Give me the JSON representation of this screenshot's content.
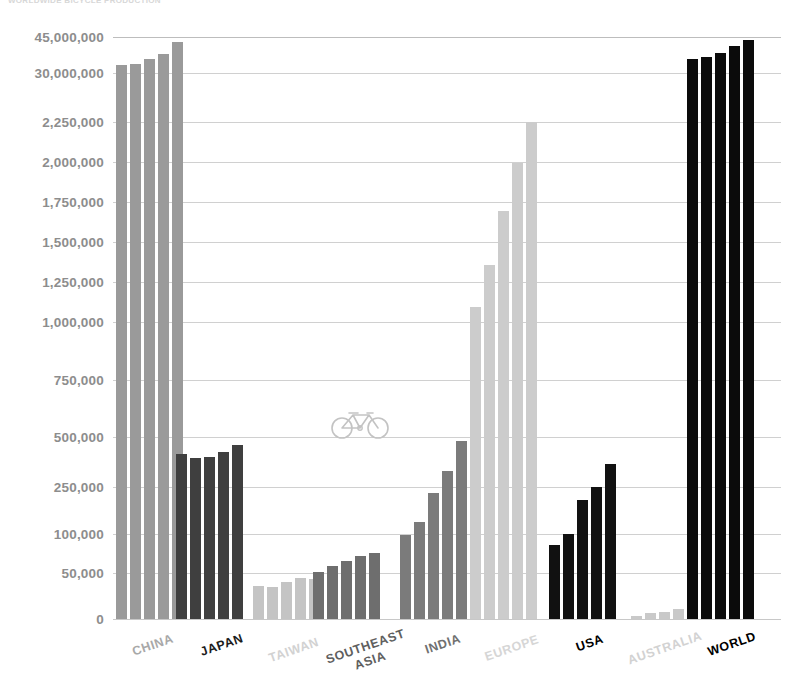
{
  "header": {
    "cropped_text": "WORLDWIDE BICYCLE PRODUCTION"
  },
  "chart_data": {
    "type": "bar",
    "title": "",
    "xlabel": "",
    "ylabel": "",
    "grid": true,
    "legend": false,
    "axis_note": "broken / non-linear y-axis: compressed above 2,250,000",
    "ytick_labels": [
      "45,000,000",
      "30,000,000",
      "2,250,000",
      "2,000,000",
      "1,750,000",
      "1,500,000",
      "1,250,000",
      "1,000,000",
      "750,000",
      "500,000",
      "250,000",
      "100,000",
      "50,000",
      "0"
    ],
    "ytick_values": [
      45000000,
      30000000,
      2250000,
      2000000,
      1750000,
      1500000,
      1250000,
      1000000,
      750000,
      500000,
      250000,
      100000,
      50000,
      0
    ],
    "ytick_y": [
      37,
      73,
      122,
      162,
      202,
      242,
      282,
      322,
      380,
      437,
      487,
      534,
      573,
      619
    ],
    "categories": [
      "CHINA",
      "JAPAN",
      "TAIWAN",
      "SOUTHEAST\nASIA",
      "INDIA",
      "EUROPE",
      "USA",
      "AUSTRALIA",
      "WORLD"
    ],
    "series_count": 5,
    "groups": [
      {
        "name": "CHINA",
        "color": "#9a9a9a",
        "label_color": "#a8a8a8",
        "values": [
          34000000,
          34200000,
          35500000,
          37000000,
          41000000
        ],
        "bar_tops_px": [
          65,
          64,
          59,
          54,
          42
        ]
      },
      {
        "name": "JAPAN",
        "color": "#3f3f3f",
        "label_color": "#1c1c1c",
        "values": [
          415000,
          388000,
          397000,
          430000,
          462000
        ],
        "bar_tops_px": [
          454,
          458,
          457,
          452,
          445
        ]
      },
      {
        "name": "TAIWAN",
        "color": "#c4c4c4",
        "label_color": "#d2d2d2",
        "values": [
          36000,
          34500,
          41000,
          47000,
          46000
        ],
        "bar_tops_px": [
          586,
          587,
          582,
          578,
          579
        ]
      },
      {
        "name": "SOUTHEAST ASIA",
        "color": "#6e6e6e",
        "label_color": "#5f5f5f",
        "values": [
          52000,
          67000,
          78000,
          90000,
          97000
        ],
        "bar_tops_px": [
          572,
          566,
          561,
          556,
          553
        ]
      },
      {
        "name": "INDIA",
        "color": "#7b7b7b",
        "label_color": "#707070",
        "values": [
          97000,
          130000,
          225000,
          330000,
          470000
        ],
        "bar_tops_px": [
          535,
          522,
          493,
          471,
          441
        ]
      },
      {
        "name": "EUROPE",
        "color": "#cccccc",
        "label_color": "#d6d6d6",
        "values": [
          1220000,
          1480000,
          1760000,
          2030000,
          2250000
        ],
        "bar_tops_px": [
          307,
          265,
          211,
          163,
          122
        ]
      },
      {
        "name": "USA",
        "color": "#111111",
        "label_color": "#000000",
        "values": [
          78000,
          100000,
          200000,
          250000,
          345000
        ],
        "bar_tops_px": [
          545,
          534,
          500,
          487,
          464
        ]
      },
      {
        "name": "AUSTRALIA",
        "color": "#c9c9c9",
        "label_color": "#d2d2d2",
        "values": [
          3000,
          5000,
          6000,
          8000,
          10000
        ],
        "bar_tops_px": [
          616,
          613,
          612,
          609,
          607
        ]
      },
      {
        "name": "WORLD",
        "color": "#0b0b0b",
        "label_color": "#000000",
        "values": [
          36000000,
          36500000,
          37500000,
          40000000,
          43500000
        ],
        "bar_tops_px": [
          59,
          57,
          53,
          46,
          40
        ]
      }
    ],
    "group_x_px": [
      116,
      176,
      253,
      313,
      400,
      470,
      549,
      631,
      687
    ],
    "bar_width_px": 11,
    "bar_gap_px": 3,
    "xlabel_positions": [
      {
        "name": "CHINA",
        "x": 153,
        "y": 638
      },
      {
        "name": "JAPAN",
        "x": 222,
        "y": 638
      },
      {
        "name": "TAIWAN",
        "x": 294,
        "y": 643
      },
      {
        "name": "SOUTHEAST\nASIA",
        "x": 368,
        "y": 639
      },
      {
        "name": "INDIA",
        "x": 443,
        "y": 637
      },
      {
        "name": "EUROPE",
        "x": 512,
        "y": 641
      },
      {
        "name": "USA",
        "x": 590,
        "y": 636
      },
      {
        "name": "AUSTRALIA",
        "x": 665,
        "y": 641
      },
      {
        "name": "WORLD",
        "x": 732,
        "y": 637
      }
    ]
  },
  "watermark": {
    "icon": "bicycle-icon",
    "color": "#c3c3c3"
  }
}
